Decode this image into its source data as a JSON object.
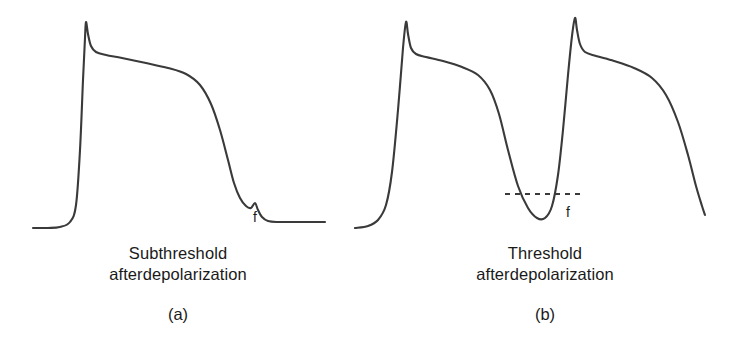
{
  "figure": {
    "background_color": "#ffffff",
    "trace_color": "#3a3a3a",
    "text_color": "#1a1a1a",
    "width": 731,
    "height": 351
  },
  "panels": [
    {
      "id": "a",
      "letter": "(a)",
      "caption_line1": "Subthreshold",
      "caption_line2": "afterdepolarization",
      "f_label": "f",
      "has_threshold_line": false
    },
    {
      "id": "b",
      "letter": "(b)",
      "caption_line1": "Threshold",
      "caption_line2": "afterdepolarization",
      "f_label": "f",
      "has_threshold_line": true
    }
  ],
  "chart_data": {
    "type": "line",
    "title": "",
    "subtitle": "",
    "xlabel": "",
    "ylabel": "",
    "grid": false,
    "legend_position": "none",
    "axis_visible": false,
    "series": [
      {
        "name": "subthreshold-trace",
        "panel": "a",
        "points": [
          [
            33,
            228
          ],
          [
            48,
            228
          ],
          [
            60,
            227
          ],
          [
            70,
            222
          ],
          [
            76,
            205
          ],
          [
            80,
            150
          ],
          [
            83,
            80
          ],
          [
            85,
            38
          ],
          [
            86,
            22
          ],
          [
            88,
            34
          ],
          [
            91,
            46
          ],
          [
            96,
            52
          ],
          [
            106,
            55
          ],
          [
            122,
            58
          ],
          [
            146,
            63
          ],
          [
            168,
            68
          ],
          [
            186,
            74
          ],
          [
            200,
            85
          ],
          [
            211,
            104
          ],
          [
            220,
            130
          ],
          [
            228,
            160
          ],
          [
            234,
            183
          ],
          [
            240,
            198
          ],
          [
            246,
            206
          ],
          [
            251,
            208
          ],
          [
            255,
            203
          ],
          [
            258,
            210
          ],
          [
            262,
            217
          ],
          [
            268,
            221
          ],
          [
            278,
            222
          ],
          [
            296,
            222
          ],
          [
            312,
            222
          ],
          [
            325,
            222
          ]
        ]
      },
      {
        "name": "threshold-trace",
        "panel": "b",
        "points": [
          [
            355,
            228
          ],
          [
            368,
            226
          ],
          [
            378,
            220
          ],
          [
            386,
            205
          ],
          [
            392,
            172
          ],
          [
            398,
            110
          ],
          [
            403,
            48
          ],
          [
            406,
            22
          ],
          [
            408,
            34
          ],
          [
            411,
            48
          ],
          [
            416,
            54
          ],
          [
            426,
            57
          ],
          [
            443,
            61
          ],
          [
            462,
            67
          ],
          [
            478,
            75
          ],
          [
            490,
            90
          ],
          [
            499,
            114
          ],
          [
            508,
            150
          ],
          [
            518,
            186
          ],
          [
            528,
            208
          ],
          [
            537,
            218
          ],
          [
            545,
            218
          ],
          [
            552,
            206
          ],
          [
            558,
            175
          ],
          [
            563,
            130
          ],
          [
            568,
            75
          ],
          [
            572,
            36
          ],
          [
            575,
            18
          ],
          [
            577,
            30
          ],
          [
            580,
            44
          ],
          [
            585,
            52
          ],
          [
            596,
            56
          ],
          [
            614,
            61
          ],
          [
            634,
            68
          ],
          [
            652,
            78
          ],
          [
            666,
            95
          ],
          [
            678,
            122
          ],
          [
            688,
            155
          ],
          [
            696,
            186
          ],
          [
            702,
            206
          ],
          [
            705,
            215
          ]
        ]
      }
    ],
    "annotations": [
      {
        "name": "f-hump-a",
        "panel": "a",
        "label": "f",
        "label_x": 257,
        "label_y": 218,
        "marker_x": 255,
        "marker_y": 203,
        "note": "subthreshold afterdepolarization hump"
      },
      {
        "name": "f-notch-b",
        "panel": "b",
        "label": "f",
        "label_x": 570,
        "label_y": 213,
        "marker_x": 541,
        "marker_y": 218,
        "note": "threshold afterdepolarization reaching threshold"
      },
      {
        "name": "threshold-line",
        "panel": "b",
        "type": "dashed-horizontal",
        "x1": 505,
        "x2": 580,
        "y": 194,
        "note": "threshold potential level"
      }
    ]
  }
}
